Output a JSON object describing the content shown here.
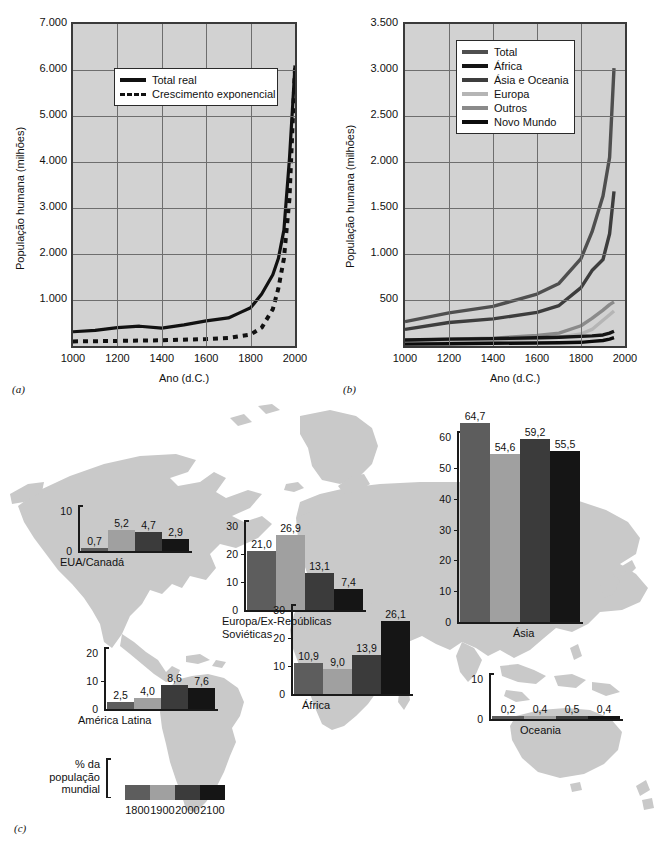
{
  "figure": {
    "panel_a_label": "(a)",
    "panel_b_label": "(b)",
    "panel_c_label": "(c)"
  },
  "chart_data": [
    {
      "id": "panel-a",
      "type": "line",
      "title": "",
      "xlabel": "Ano (d.C.)",
      "ylabel": "População humana (milhões)",
      "xlim": [
        1000,
        2000
      ],
      "ylim": [
        0,
        7000
      ],
      "xticks": [
        "1000",
        "1200",
        "1400",
        "1600",
        "1800",
        "2000"
      ],
      "yticks": [
        "1.000",
        "2.000",
        "3.000",
        "4.000",
        "5.000",
        "6.000",
        "7.000"
      ],
      "grid": true,
      "legend_position": "upper-center",
      "series": [
        {
          "name": "Total real",
          "style": "solid",
          "color": "#111111",
          "x": [
            1000,
            1100,
            1200,
            1300,
            1400,
            1500,
            1600,
            1700,
            1750,
            1800,
            1850,
            1900,
            1925,
            1950,
            1975,
            1990,
            2000
          ],
          "values": [
            310,
            340,
            400,
            430,
            390,
            460,
            545,
            610,
            720,
            830,
            1130,
            1550,
            1900,
            2520,
            4070,
            5270,
            6100
          ]
        },
        {
          "name": "Crescimento exponencial",
          "style": "dashed",
          "color": "#111111",
          "x": [
            1000,
            1200,
            1400,
            1600,
            1700,
            1800,
            1850,
            1900,
            1925,
            1950,
            1975,
            1990,
            2000
          ],
          "values": [
            100,
            110,
            125,
            150,
            175,
            250,
            400,
            800,
            1250,
            1900,
            3200,
            4900,
            6050
          ]
        }
      ]
    },
    {
      "id": "panel-b",
      "type": "line",
      "title": "",
      "xlabel": "Ano (d.C.)",
      "ylabel": "População humana (milhões)",
      "xlim": [
        1000,
        2000
      ],
      "ylim": [
        0,
        3500
      ],
      "xticks": [
        "1000",
        "1200",
        "1400",
        "1600",
        "1800",
        "2000"
      ],
      "yticks": [
        "500",
        "1.000",
        "1.500",
        "2.000",
        "2.500",
        "3.000",
        "3.500"
      ],
      "grid": true,
      "legend_position": "upper-center",
      "series": [
        {
          "name": "Total",
          "color": "#4f4f4f",
          "x": [
            1000,
            1200,
            1400,
            1600,
            1700,
            1800,
            1850,
            1900,
            1930,
            1950
          ],
          "values": [
            265,
            360,
            430,
            565,
            680,
            950,
            1240,
            1630,
            2050,
            3020
          ]
        },
        {
          "name": "África",
          "color": "#151515",
          "x": [
            1000,
            1200,
            1400,
            1600,
            1700,
            1800,
            1850,
            1900,
            1930,
            1950
          ],
          "values": [
            65,
            75,
            80,
            90,
            95,
            105,
            110,
            120,
            140,
            160
          ]
        },
        {
          "name": "Ásia e Oceania",
          "color": "#3d3d3d",
          "x": [
            1000,
            1200,
            1400,
            1600,
            1700,
            1800,
            1850,
            1900,
            1930,
            1950
          ],
          "values": [
            180,
            255,
            295,
            365,
            440,
            635,
            820,
            940,
            1220,
            1680
          ]
        },
        {
          "name": "Europa",
          "color": "#b5b5b5",
          "x": [
            1000,
            1200,
            1400,
            1600,
            1700,
            1800,
            1850,
            1900,
            1930,
            1950
          ],
          "values": [
            40,
            55,
            60,
            80,
            95,
            130,
            180,
            280,
            340,
            380
          ]
        },
        {
          "name": "Outros",
          "color": "#8a8a8a",
          "x": [
            1000,
            1200,
            1400,
            1600,
            1700,
            1800,
            1850,
            1900,
            1930,
            1950
          ],
          "values": [
            60,
            75,
            85,
            115,
            140,
            220,
            300,
            390,
            450,
            480
          ]
        },
        {
          "name": "Novo Mundo",
          "color": "#0c0c0c",
          "x": [
            1000,
            1200,
            1400,
            1600,
            1700,
            1800,
            1850,
            1900,
            1930,
            1950
          ],
          "values": [
            20,
            25,
            30,
            32,
            35,
            40,
            50,
            60,
            75,
            90
          ]
        }
      ]
    },
    {
      "id": "panel-c",
      "type": "bar",
      "title": "% da população mundial",
      "categories": [
        "1800",
        "1900",
        "2000",
        "2100"
      ],
      "colors": [
        "#5d5d5d",
        "#a0a0a0",
        "#3b3b3b",
        "#151515"
      ],
      "regions": [
        {
          "name": "EUA/Canadá",
          "values": [
            0.7,
            5.2,
            4.7,
            2.9
          ],
          "labels": [
            "0,7",
            "5,2",
            "4,7",
            "2,9"
          ],
          "yticks": [
            "0",
            "10"
          ],
          "ymax": 10
        },
        {
          "name": "América Latina",
          "values": [
            2.5,
            4.0,
            8.6,
            7.6
          ],
          "labels": [
            "2,5",
            "4,0",
            "8,6",
            "7,6"
          ],
          "yticks": [
            "0",
            "10",
            "20"
          ],
          "ymax": 20
        },
        {
          "name": "Europa/Ex-Repúblicas Soviéticas",
          "name_line1": "Europa/Ex-Repúblicas",
          "name_line2": "Soviéticas",
          "values": [
            21.0,
            26.9,
            13.1,
            7.4
          ],
          "labels": [
            "21,0",
            "26,9",
            "13,1",
            "7,4"
          ],
          "yticks": [
            "0",
            "10",
            "20",
            "30"
          ],
          "ymax": 30
        },
        {
          "name": "África",
          "values": [
            10.9,
            9.0,
            13.9,
            26.1
          ],
          "labels": [
            "10,9",
            "9,0",
            "13,9",
            "26,1"
          ],
          "yticks": [
            "0",
            "10",
            "20",
            "30"
          ],
          "ymax": 30
        },
        {
          "name": "Ásia",
          "values": [
            64.7,
            54.6,
            59.2,
            55.5
          ],
          "labels": [
            "64,7",
            "54,6",
            "59,2",
            "55,5"
          ],
          "yticks": [
            "0",
            "10",
            "20",
            "30",
            "40",
            "50",
            "60"
          ],
          "ymax": 60
        },
        {
          "name": "Oceania",
          "values": [
            0.2,
            0.4,
            0.5,
            0.4
          ],
          "labels": [
            "0,2",
            "0,4",
            "0,5",
            "0,4"
          ],
          "yticks": [
            "0",
            "10"
          ],
          "ymax": 10
        }
      ],
      "key": {
        "line1": "% da",
        "line2": "população",
        "line3": "mundial",
        "years": [
          "1800",
          "1900",
          "2000",
          "2100"
        ]
      }
    }
  ],
  "panel_a": {
    "ylabel": "População humana (milhões)",
    "xlabel": "Ano (d.C.)",
    "yticks": [
      "7.000",
      "6.000",
      "5.000",
      "4.000",
      "3.000",
      "2.000",
      "1.000"
    ],
    "xticks": [
      "1000",
      "1200",
      "1400",
      "1600",
      "1800",
      "2000"
    ],
    "legend": [
      {
        "label": "Total real",
        "style": "solid"
      },
      {
        "label": "Crescimento exponencial",
        "style": "dashed"
      }
    ]
  },
  "panel_b": {
    "ylabel": "População humana (milhões)",
    "xlabel": "Ano (d.C.)",
    "yticks": [
      "3.500",
      "3.000",
      "2.500",
      "2.000",
      "1.500",
      "1.000",
      "500"
    ],
    "xticks": [
      "1000",
      "1200",
      "1400",
      "1600",
      "1800",
      "2000"
    ],
    "legend": [
      {
        "label": "Total",
        "color": "#4f4f4f"
      },
      {
        "label": "África",
        "color": "#151515"
      },
      {
        "label": "Ásia e Oceania",
        "color": "#3d3d3d"
      },
      {
        "label": "Europa",
        "color": "#b5b5b5"
      },
      {
        "label": "Outros",
        "color": "#8a8a8a"
      },
      {
        "label": "Novo Mundo",
        "color": "#0c0c0c"
      }
    ]
  },
  "panel_c": {
    "map_color": "#c9c9c9",
    "key": {
      "line1": "% da",
      "line2": "população",
      "line3": "mundial",
      "years": [
        "1800",
        "1900",
        "2000",
        "2100"
      ],
      "colors": [
        "#5d5d5d",
        "#a0a0a0",
        "#3b3b3b",
        "#151515"
      ]
    }
  }
}
